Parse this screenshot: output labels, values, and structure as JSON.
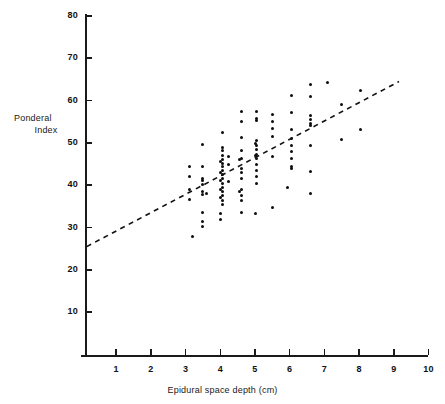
{
  "figure": {
    "background": "#ffffff",
    "ink_color": "#111111",
    "point_color": "#0d0d0d"
  },
  "axes": {
    "y_title_line1": "Ponderal",
    "y_title_line2": "Index",
    "x_title": "Epidural space depth (cm)",
    "y_ticks": [
      "10",
      "20",
      "30",
      "40",
      "50",
      "60",
      "70",
      "80"
    ],
    "x_ticks": [
      "1",
      "2",
      "3",
      "4",
      "5",
      "6",
      "7",
      "8",
      "9",
      "10"
    ]
  },
  "chart_data": {
    "type": "scatter",
    "title": "",
    "xlabel": "Epidural space depth (cm)",
    "ylabel": "Ponderal Index",
    "xlim": [
      0,
      10
    ],
    "ylim": [
      0,
      80
    ],
    "xticks": [
      1,
      2,
      3,
      4,
      5,
      6,
      7,
      8,
      9,
      10
    ],
    "yticks": [
      10,
      20,
      30,
      40,
      50,
      60,
      70,
      80
    ],
    "grid": false,
    "legend": "none",
    "series": [
      {
        "name": "observations",
        "marker": "filled-circle",
        "points": [
          [
            3.1,
            44.5
          ],
          [
            3.1,
            42.0
          ],
          [
            3.1,
            39.0
          ],
          [
            3.1,
            36.7
          ],
          [
            3.2,
            27.8
          ],
          [
            3.5,
            49.7
          ],
          [
            3.5,
            44.5
          ],
          [
            3.5,
            41.5
          ],
          [
            3.5,
            41.0
          ],
          [
            3.5,
            40.2
          ],
          [
            3.5,
            38.5
          ],
          [
            3.5,
            37.8
          ],
          [
            3.6,
            38.0
          ],
          [
            3.5,
            33.5
          ],
          [
            3.5,
            31.5
          ],
          [
            3.5,
            30.3
          ],
          [
            4.05,
            52.5
          ],
          [
            4.05,
            49.0
          ],
          [
            4.05,
            48.2
          ],
          [
            4.05,
            47.0
          ],
          [
            4.05,
            46.0
          ],
          [
            4.05,
            45.2
          ],
          [
            4.05,
            44.4
          ],
          [
            4.05,
            43.5
          ],
          [
            4.05,
            42.6
          ],
          [
            4.05,
            41.5
          ],
          [
            4.05,
            40.5
          ],
          [
            4.05,
            39.5
          ],
          [
            4.05,
            38.5
          ],
          [
            4.05,
            37.5
          ],
          [
            4.05,
            36.5
          ],
          [
            4.05,
            35.5
          ],
          [
            4.0,
            45.5
          ],
          [
            4.0,
            43.0
          ],
          [
            4.0,
            41.0
          ],
          [
            4.0,
            39.0
          ],
          [
            4.0,
            37.0
          ],
          [
            4.0,
            33.4
          ],
          [
            4.0,
            31.8
          ],
          [
            4.25,
            46.8
          ],
          [
            4.25,
            45.0
          ],
          [
            4.25,
            40.8
          ],
          [
            4.6,
            57.5
          ],
          [
            4.6,
            55.0
          ],
          [
            4.6,
            51.3
          ],
          [
            4.6,
            48.3
          ],
          [
            4.6,
            46.2
          ],
          [
            4.6,
            44.0
          ],
          [
            4.6,
            43.0
          ],
          [
            4.6,
            41.5
          ],
          [
            4.6,
            39.0
          ],
          [
            4.6,
            37.5
          ],
          [
            4.6,
            36.5
          ],
          [
            4.6,
            33.5
          ],
          [
            4.55,
            46.0
          ],
          [
            4.55,
            38.5
          ],
          [
            5.05,
            57.5
          ],
          [
            5.05,
            55.7
          ],
          [
            5.05,
            55.2
          ],
          [
            5.05,
            50.5
          ],
          [
            5.05,
            49.5
          ],
          [
            5.05,
            48.5
          ],
          [
            5.05,
            47.3
          ],
          [
            5.05,
            46.2
          ],
          [
            5.05,
            45.0
          ],
          [
            5.05,
            43.5
          ],
          [
            5.05,
            42.0
          ],
          [
            5.05,
            40.5
          ],
          [
            5.0,
            49.8
          ],
          [
            5.0,
            47.0
          ],
          [
            5.0,
            33.3
          ],
          [
            5.5,
            56.8
          ],
          [
            5.5,
            55.0
          ],
          [
            5.5,
            53.3
          ],
          [
            5.5,
            51.5
          ],
          [
            5.5,
            46.8
          ],
          [
            5.5,
            34.8
          ],
          [
            6.05,
            61.2
          ],
          [
            6.05,
            57.2
          ],
          [
            6.05,
            53.2
          ],
          [
            6.05,
            51.0
          ],
          [
            6.05,
            49.5
          ],
          [
            6.05,
            48.0
          ],
          [
            6.05,
            46.3
          ],
          [
            6.05,
            44.5
          ],
          [
            6.05,
            44.0
          ],
          [
            5.95,
            39.5
          ],
          [
            6.6,
            63.8
          ],
          [
            6.6,
            61.0
          ],
          [
            6.6,
            56.5
          ],
          [
            6.6,
            55.5
          ],
          [
            6.6,
            54.5
          ],
          [
            6.6,
            54.2
          ],
          [
            6.6,
            49.3
          ],
          [
            6.6,
            43.2
          ],
          [
            6.6,
            38.0
          ],
          [
            7.1,
            64.3
          ],
          [
            7.5,
            50.8
          ],
          [
            8.05,
            62.3
          ],
          [
            8.05,
            53.2
          ],
          [
            7.5,
            59.0
          ]
        ]
      }
    ],
    "fit_line": {
      "style": "dashed",
      "x_start": 0.15,
      "y_start": 25.5,
      "x_end": 9.15,
      "y_end": 64.5
    }
  }
}
